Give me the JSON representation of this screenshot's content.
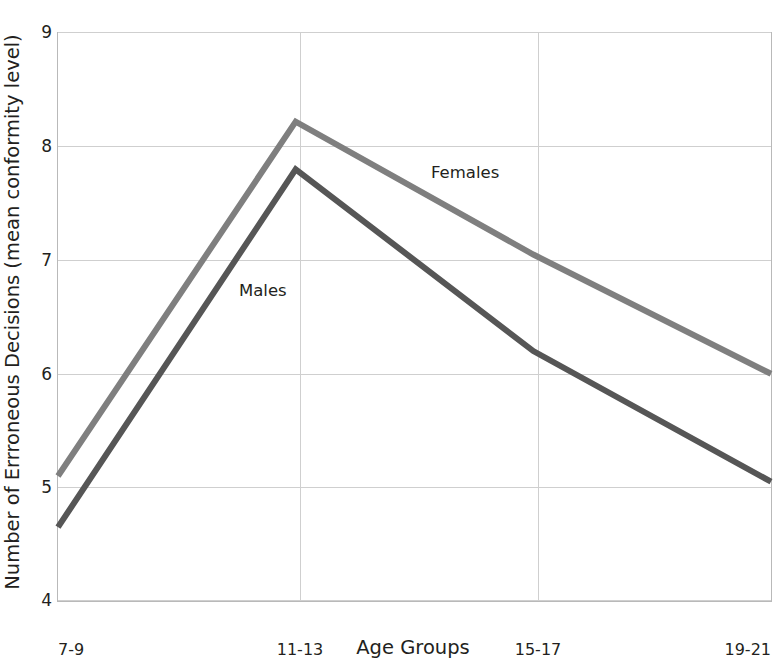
{
  "chart_data": {
    "type": "line",
    "title": "",
    "categories": [
      "7-9",
      "11-13",
      "15-17",
      "19-21"
    ],
    "xlabel": "Age Groups",
    "ylabel": "Number of Errroneous Decisions (mean conformity level)",
    "ylim": [
      4,
      9
    ],
    "yticks": [
      "9",
      "8",
      "7",
      "6",
      "5",
      "4"
    ],
    "ytick_values": [
      9,
      8,
      7,
      6,
      5,
      4
    ],
    "grid": true,
    "legend": "inline-labels",
    "series": [
      {
        "name": "Females",
        "values": [
          5.1,
          8.22,
          7.05,
          6.0
        ],
        "color": "#7f7f7f"
      },
      {
        "name": "Males",
        "values": [
          4.65,
          7.8,
          6.2,
          5.05
        ],
        "color": "#565656"
      }
    ]
  },
  "axes": {
    "x_title": "Age Groups",
    "y_title": "Number of Errroneous Decisions (mean conformity level)",
    "x_tick_labels": [
      "7-9",
      "11-13",
      "15-17",
      "19-21"
    ],
    "y_tick_labels": [
      "9",
      "8",
      "7",
      "6",
      "5",
      "4"
    ]
  },
  "labels": {
    "females": "Females",
    "males": "Males"
  },
  "colors": {
    "females_line": "#7f7f7f",
    "males_line": "#565656",
    "grid": "#cfcfcf",
    "frame": "#b9b9b9",
    "text": "#231f20",
    "background": "#ffffff"
  }
}
